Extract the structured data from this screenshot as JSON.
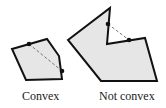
{
  "diagram": {
    "colors": {
      "fill": "#e6e6e6",
      "stroke": "#111111",
      "dash": "#777777"
    },
    "shapes": [
      {
        "id": "convex",
        "label": "Convex",
        "polygon": [
          [
            12,
            49
          ],
          [
            47,
            39
          ],
          [
            59,
            56
          ],
          [
            62,
            79
          ],
          [
            26,
            80
          ]
        ],
        "segment": [
          [
            29,
            44
          ],
          [
            62,
            71
          ]
        ]
      },
      {
        "id": "not-convex",
        "label": "Not convex",
        "polygon": [
          [
            68,
            40
          ],
          [
            110,
            8
          ],
          [
            107,
            44
          ],
          [
            145,
            38
          ],
          [
            157,
            81
          ],
          [
            101,
            81
          ]
        ],
        "segment": [
          [
            108,
            24
          ],
          [
            129,
            40
          ]
        ]
      }
    ]
  }
}
